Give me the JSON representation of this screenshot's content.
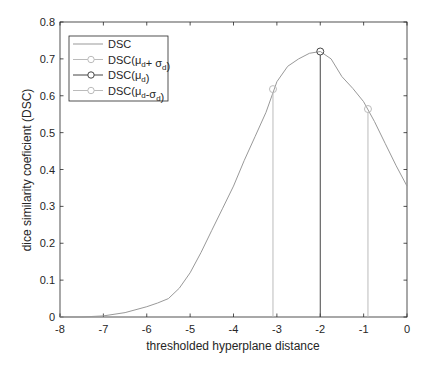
{
  "chart_data": {
    "type": "line",
    "title": "",
    "xlabel": "thresholded hyperplane distance",
    "ylabel": "dice similarity coeficient (DSC)",
    "xlim": [
      -8,
      0
    ],
    "ylim": [
      0,
      0.8
    ],
    "xticks": [
      "-8",
      "-7",
      "-6",
      "-5",
      "-4",
      "-3",
      "-2",
      "-1",
      "0"
    ],
    "yticks": [
      "0",
      "0.1",
      "0.2",
      "0.3",
      "0.4",
      "0.5",
      "0.6",
      "0.7",
      "0.8"
    ],
    "grid": false,
    "legend_position": "upper-left",
    "series": [
      {
        "name": "DSC",
        "color": "#999999",
        "x": [
          -8,
          -7.5,
          -7,
          -6.5,
          -6,
          -5.75,
          -5.5,
          -5.25,
          -5,
          -4.75,
          -4.5,
          -4.25,
          -4,
          -3.75,
          -3.5,
          -3.25,
          -3,
          -2.75,
          -2.5,
          -2.25,
          -2,
          -1.75,
          -1.5,
          -1.25,
          -1,
          -0.75,
          -0.5,
          -0.25,
          0
        ],
        "y": [
          0,
          0,
          0.003,
          0.012,
          0.028,
          0.038,
          0.05,
          0.078,
          0.12,
          0.175,
          0.235,
          0.295,
          0.355,
          0.425,
          0.49,
          0.555,
          0.638,
          0.68,
          0.7,
          0.715,
          0.72,
          0.7,
          0.652,
          0.62,
          0.584,
          0.53,
          0.47,
          0.41,
          0.355
        ]
      },
      {
        "name": "DSC(μ_d + σ_d)",
        "color": "#bbbbbb",
        "x": [
          -3.09
        ],
        "y": [
          0.618
        ],
        "marker": "circle",
        "stem": true
      },
      {
        "name": "DSC(μ_d)",
        "color": "#444444",
        "x": [
          -2.0
        ],
        "y": [
          0.72
        ],
        "marker": "circle",
        "stem": true
      },
      {
        "name": "DSC(μ_d-σ_d)",
        "color": "#bbbbbb",
        "x": [
          -0.9
        ],
        "y": [
          0.564
        ],
        "marker": "circle",
        "stem": true
      }
    ]
  },
  "legend": {
    "items": [
      {
        "label_main": "DSC",
        "color": "#999999",
        "marker": false
      },
      {
        "label_main": "DSC(μ",
        "sub1": "d",
        "mid": "+ σ",
        "sub2": "d",
        "end": ")",
        "color": "#bbbbbb",
        "marker": true
      },
      {
        "label_main": "DSC(μ",
        "sub1": "d",
        "mid": "",
        "sub2": "",
        "end": ")",
        "color": "#444444",
        "marker": true
      },
      {
        "label_main": "DSC(μ",
        "sub1": "d",
        "mid": "-σ",
        "sub2": "d",
        "end": ")",
        "color": "#bbbbbb",
        "marker": true
      }
    ]
  }
}
